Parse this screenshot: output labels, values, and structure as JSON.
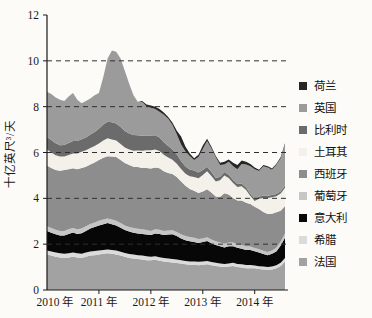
{
  "figure": {
    "background": "#fcfbf8"
  },
  "chart_data": {
    "type": "area",
    "stacked": true,
    "title": "",
    "ylabel": "十亿英尺³/天",
    "xlabel": "",
    "x_start_year": 2010,
    "x_months_per_point": 1,
    "x_tick_labels": [
      "2010 年",
      "2011 年",
      "2012 年",
      "2013 年",
      "2014 年"
    ],
    "y_ticks": [
      0,
      2,
      4,
      6,
      8,
      10,
      12
    ],
    "ylim": [
      0,
      12
    ],
    "grid_values": [
      2,
      4,
      6,
      8,
      10
    ],
    "grid_style": "dashed",
    "legend_position": "right",
    "legend_order_top_to_bottom": [
      "荷兰",
      "英国",
      "比利时",
      "土耳其",
      "西班牙",
      "葡萄牙",
      "意大利",
      "希腊",
      "法国"
    ],
    "series": [
      {
        "name": "france",
        "label": "法国",
        "color": "#a2a2a2",
        "values": [
          1.55,
          1.5,
          1.45,
          1.42,
          1.4,
          1.42,
          1.45,
          1.42,
          1.4,
          1.45,
          1.5,
          1.52,
          1.55,
          1.58,
          1.6,
          1.58,
          1.55,
          1.5,
          1.45,
          1.4,
          1.38,
          1.35,
          1.33,
          1.3,
          1.3,
          1.32,
          1.28,
          1.25,
          1.22,
          1.2,
          1.18,
          1.15,
          1.12,
          1.1,
          1.1,
          1.08,
          1.1,
          1.12,
          1.08,
          1.05,
          1.02,
          1.0,
          1.02,
          1.05,
          1.0,
          0.98,
          0.95,
          0.95,
          0.95,
          0.92,
          0.9,
          0.88,
          0.9,
          0.95,
          1.05,
          1.25
        ]
      },
      {
        "name": "greece",
        "label": "希腊",
        "color": "#dbdbdb",
        "values": [
          0.18,
          0.18,
          0.18,
          0.18,
          0.18,
          0.18,
          0.18,
          0.18,
          0.18,
          0.18,
          0.18,
          0.18,
          0.17,
          0.17,
          0.17,
          0.17,
          0.17,
          0.17,
          0.17,
          0.17,
          0.17,
          0.17,
          0.17,
          0.17,
          0.15,
          0.15,
          0.15,
          0.15,
          0.15,
          0.15,
          0.15,
          0.15,
          0.15,
          0.15,
          0.15,
          0.15,
          0.14,
          0.14,
          0.14,
          0.14,
          0.14,
          0.14,
          0.14,
          0.14,
          0.14,
          0.14,
          0.14,
          0.14,
          0.12,
          0.12,
          0.12,
          0.12,
          0.13,
          0.13,
          0.14,
          0.15
        ]
      },
      {
        "name": "italy",
        "label": "意大利",
        "color": "#070707",
        "values": [
          0.85,
          0.82,
          0.8,
          0.78,
          0.8,
          0.85,
          0.88,
          0.85,
          0.9,
          0.95,
          1.0,
          1.05,
          1.1,
          1.12,
          1.15,
          1.12,
          1.1,
          1.05,
          1.0,
          0.98,
          0.95,
          0.95,
          0.95,
          0.95,
          0.95,
          1.0,
          1.02,
          1.0,
          1.05,
          1.08,
          1.02,
          0.95,
          0.9,
          0.88,
          0.85,
          0.82,
          0.85,
          0.88,
          0.82,
          0.78,
          0.75,
          0.72,
          0.75,
          0.72,
          0.7,
          0.68,
          0.66,
          0.65,
          0.62,
          0.6,
          0.55,
          0.52,
          0.55,
          0.6,
          0.75,
          0.88
        ]
      },
      {
        "name": "portugal",
        "label": "葡萄牙",
        "color": "#c6c6c6",
        "values": [
          0.2,
          0.2,
          0.2,
          0.2,
          0.2,
          0.2,
          0.2,
          0.2,
          0.2,
          0.2,
          0.2,
          0.2,
          0.2,
          0.2,
          0.2,
          0.2,
          0.2,
          0.2,
          0.2,
          0.2,
          0.2,
          0.2,
          0.2,
          0.2,
          0.18,
          0.18,
          0.18,
          0.18,
          0.18,
          0.18,
          0.18,
          0.18,
          0.18,
          0.18,
          0.18,
          0.18,
          0.16,
          0.16,
          0.16,
          0.16,
          0.16,
          0.16,
          0.16,
          0.16,
          0.16,
          0.16,
          0.16,
          0.16,
          0.14,
          0.14,
          0.14,
          0.14,
          0.15,
          0.16,
          0.17,
          0.18
        ]
      },
      {
        "name": "spain",
        "label": "西班牙",
        "color": "#8d8d8d",
        "values": [
          2.65,
          2.62,
          2.6,
          2.62,
          2.65,
          2.62,
          2.6,
          2.62,
          2.65,
          2.6,
          2.6,
          2.62,
          2.65,
          2.7,
          2.72,
          2.75,
          2.78,
          2.75,
          2.72,
          2.7,
          2.68,
          2.7,
          2.68,
          2.7,
          2.72,
          2.7,
          2.68,
          2.6,
          2.5,
          2.45,
          2.4,
          2.3,
          2.2,
          2.1,
          2.05,
          2.0,
          2.05,
          2.1,
          2.05,
          1.95,
          2.0,
          2.2,
          2.1,
          1.95,
          1.9,
          1.95,
          1.9,
          1.85,
          1.8,
          1.75,
          1.7,
          1.65,
          1.6,
          1.55,
          1.35,
          1.2
        ]
      },
      {
        "name": "turkey",
        "label": "土耳其",
        "color": "#f3f1ea",
        "values": [
          0.7,
          0.68,
          0.65,
          0.62,
          0.6,
          0.62,
          0.65,
          0.68,
          0.7,
          0.72,
          0.72,
          0.72,
          0.72,
          0.75,
          0.78,
          0.75,
          0.72,
          0.7,
          0.68,
          0.68,
          0.7,
          0.72,
          0.75,
          0.78,
          0.8,
          0.78,
          0.75,
          0.72,
          0.68,
          0.62,
          0.58,
          0.55,
          0.52,
          0.55,
          0.6,
          0.65,
          0.72,
          0.78,
          0.72,
          0.65,
          0.72,
          0.78,
          0.72,
          0.65,
          0.6,
          0.62,
          0.55,
          0.35,
          0.25,
          0.45,
          0.6,
          0.7,
          0.72,
          0.7,
          0.75,
          0.8
        ]
      },
      {
        "name": "belgium",
        "label": "比利时",
        "color": "#6b6b6b",
        "values": [
          0.55,
          0.54,
          0.52,
          0.5,
          0.5,
          0.52,
          0.54,
          0.55,
          0.55,
          0.56,
          0.58,
          0.6,
          0.65,
          0.7,
          0.72,
          0.75,
          0.75,
          0.74,
          0.72,
          0.7,
          0.68,
          0.66,
          0.65,
          0.64,
          0.64,
          0.62,
          0.6,
          0.55,
          0.5,
          0.45,
          0.4,
          0.35,
          0.32,
          0.3,
          0.28,
          0.25,
          0.22,
          0.2,
          0.18,
          0.16,
          0.15,
          0.15,
          0.14,
          0.13,
          0.12,
          0.12,
          0.11,
          0.1,
          0.1,
          0.1,
          0.1,
          0.1,
          0.1,
          0.1,
          0.1,
          0.1
        ]
      },
      {
        "name": "uk",
        "label": "英国",
        "color": "#9b9b9b",
        "values": [
          1.97,
          2.01,
          2.0,
          1.98,
          1.92,
          2.04,
          2.1,
          1.8,
          1.57,
          1.59,
          1.57,
          1.61,
          1.56,
          2.08,
          2.76,
          3.13,
          3.13,
          2.99,
          2.61,
          2.17,
          1.74,
          1.45,
          1.47,
          1.28,
          1.21,
          1.15,
          1.12,
          1.2,
          1.19,
          1.07,
          0.89,
          0.72,
          0.66,
          0.59,
          0.46,
          0.67,
          0.91,
          1.12,
          1.02,
          0.9,
          0.51,
          0.33,
          0.57,
          0.6,
          0.65,
          0.85,
          1.01,
          1.2,
          1.29,
          1.11,
          1.29,
          1.23,
          1.1,
          1.26,
          1.44,
          1.79
        ]
      },
      {
        "name": "netherlands",
        "label": "荷兰",
        "color": "#262626",
        "values": [
          0,
          0,
          0,
          0,
          0,
          0,
          0,
          0,
          0,
          0,
          0,
          0,
          0,
          0,
          0,
          0,
          0,
          0,
          0,
          0,
          0,
          0,
          0.05,
          0.08,
          0.1,
          0.1,
          0.12,
          0.1,
          0.08,
          0.1,
          0.15,
          0.35,
          0.2,
          0.1,
          0.08,
          0.1,
          0.15,
          0.1,
          0.08,
          0.06,
          0.1,
          0.12,
          0.1,
          0.15,
          0.18,
          0.15,
          0.12,
          0.1,
          0.08,
          0.06,
          0.05,
          0.06,
          0.05,
          0.05,
          0.05,
          0.05
        ]
      }
    ]
  },
  "colors": {
    "grid": "#2f2f2f",
    "axis": "#1a1a1a",
    "tick_text": "#1a1a1a"
  }
}
